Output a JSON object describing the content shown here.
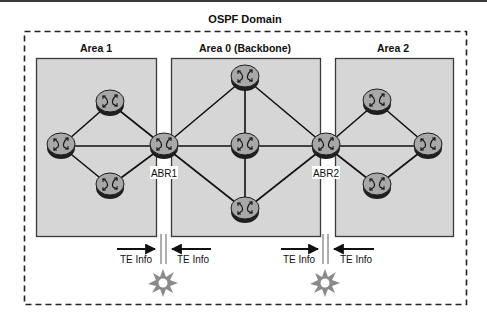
{
  "domain": {
    "title": "OSPF Domain"
  },
  "areas": [
    {
      "id": "area1",
      "title": "Area 1"
    },
    {
      "id": "area0",
      "title": "Area 0 (Backbone)"
    },
    {
      "id": "area2",
      "title": "Area 2"
    }
  ],
  "routers": {
    "abr1": {
      "label": "ABR1"
    },
    "abr2": {
      "label": "ABR2"
    }
  },
  "te_flows": [
    {
      "left_label": "TE Info",
      "right_label": "TE Info"
    },
    {
      "left_label": "TE Info",
      "right_label": "TE Info"
    }
  ],
  "icons": {
    "router": "router-icon",
    "break": "starburst-icon"
  },
  "colors": {
    "area_fill": "#d6d6d6",
    "area_border": "#3a3a3a",
    "router_top": "#a8a8a8",
    "router_base": "#1e1e1e",
    "link": "#111111",
    "burst": "#8a8a8a"
  }
}
